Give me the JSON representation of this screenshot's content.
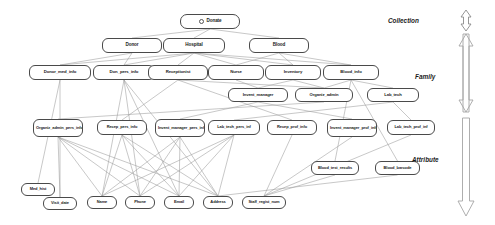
{
  "diagram": {
    "background": "#ffffff",
    "node_border_color": "#4a4a4a",
    "edge_color": "#9a9a9a",
    "levels": [
      {
        "name": "Collection",
        "label": "Collection"
      },
      {
        "name": "Family",
        "label": "Family"
      },
      {
        "name": "Attribute",
        "label": "Attribute"
      }
    ],
    "root_icon": "circle-node-icon",
    "nodes": [
      {
        "id": "donate",
        "label": "Donate",
        "x": 180,
        "y": 14,
        "w": 60,
        "h": 15,
        "fs": 4.6,
        "root": true
      },
      {
        "id": "donor",
        "label": "Donor",
        "x": 102,
        "y": 38,
        "w": 60,
        "h": 15,
        "fs": 4.6
      },
      {
        "id": "hospital",
        "label": "Hospital",
        "x": 163,
        "y": 38,
        "w": 62,
        "h": 15,
        "fs": 4.6
      },
      {
        "id": "blood",
        "label": "Blood",
        "x": 249,
        "y": 38,
        "w": 60,
        "h": 15,
        "fs": 4.6
      },
      {
        "id": "donor_med_info",
        "label": "Donor_med_info",
        "x": 29,
        "y": 65,
        "w": 62,
        "h": 15,
        "fs": 4.3
      },
      {
        "id": "don_pers_info",
        "label": "Don_pers_info",
        "x": 93,
        "y": 65,
        "w": 62,
        "h": 15,
        "fs": 4.3
      },
      {
        "id": "receptionist",
        "label": "Receptionist",
        "x": 148,
        "y": 65,
        "w": 60,
        "h": 15,
        "fs": 4.3
      },
      {
        "id": "nurse",
        "label": "Nurse",
        "x": 208,
        "y": 65,
        "w": 56,
        "h": 15,
        "fs": 4.3
      },
      {
        "id": "inventory",
        "label": "Inventory",
        "x": 265,
        "y": 65,
        "w": 56,
        "h": 15,
        "fs": 4.3
      },
      {
        "id": "blood_info",
        "label": "Blood_info",
        "x": 323,
        "y": 65,
        "w": 56,
        "h": 15,
        "fs": 4.3
      },
      {
        "id": "invent_manager",
        "label": "Invent_manager",
        "x": 228,
        "y": 88,
        "w": 60,
        "h": 14,
        "fs": 4.2
      },
      {
        "id": "organiz_admin",
        "label": "Organiz_admin",
        "x": 295,
        "y": 88,
        "w": 58,
        "h": 14,
        "fs": 4.2
      },
      {
        "id": "lab_tech",
        "label": "Lab_tech",
        "x": 367,
        "y": 88,
        "w": 52,
        "h": 14,
        "fs": 4.2
      },
      {
        "id": "organiz_admin_pers",
        "label": "Organiz_admin_pers_info",
        "x": 33,
        "y": 119,
        "w": 50,
        "h": 18,
        "fs": 4.0,
        "two": true
      },
      {
        "id": "recep_pers_info",
        "label": "Recep_pers_info",
        "x": 97,
        "y": 120,
        "w": 50,
        "h": 15,
        "fs": 4.0
      },
      {
        "id": "invent_manager_pers",
        "label": "Invent_manager_pers_info",
        "x": 155,
        "y": 119,
        "w": 50,
        "h": 18,
        "fs": 4.0,
        "two": true
      },
      {
        "id": "lab_tech_pers_inf",
        "label": "Lab_tech_pers_inf",
        "x": 208,
        "y": 120,
        "w": 52,
        "h": 15,
        "fs": 4.0
      },
      {
        "id": "recep_prof_info",
        "label": "Recep_prof_info",
        "x": 267,
        "y": 120,
        "w": 50,
        "h": 15,
        "fs": 4.0
      },
      {
        "id": "invent_manager_prof",
        "label": "Invent_manager_prof_info",
        "x": 327,
        "y": 119,
        "w": 50,
        "h": 18,
        "fs": 4.0,
        "two": true
      },
      {
        "id": "lab_tech_prof_inf",
        "label": "Lab_tech_prof_inf",
        "x": 387,
        "y": 120,
        "w": 48,
        "h": 15,
        "fs": 4.0
      },
      {
        "id": "blood_test_results",
        "label": "Blood_test_results",
        "x": 311,
        "y": 161,
        "w": 48,
        "h": 14,
        "fs": 4.0
      },
      {
        "id": "blood_barcode",
        "label": "Blood_barcode",
        "x": 375,
        "y": 161,
        "w": 45,
        "h": 14,
        "fs": 4.0
      },
      {
        "id": "med_hist",
        "label": "Med_hist",
        "x": 21,
        "y": 183,
        "w": 34,
        "h": 13,
        "fs": 4.0
      },
      {
        "id": "visit_date",
        "label": "Visit_date",
        "x": 43,
        "y": 197,
        "w": 34,
        "h": 13,
        "fs": 4.0
      },
      {
        "id": "name",
        "label": "Name",
        "x": 87,
        "y": 196,
        "w": 30,
        "h": 13,
        "fs": 4.0
      },
      {
        "id": "phone",
        "label": "Phone",
        "x": 125,
        "y": 196,
        "w": 30,
        "h": 13,
        "fs": 4.0
      },
      {
        "id": "email",
        "label": "Email",
        "x": 164,
        "y": 196,
        "w": 30,
        "h": 13,
        "fs": 4.0
      },
      {
        "id": "address",
        "label": "Address",
        "x": 203,
        "y": 196,
        "w": 30,
        "h": 13,
        "fs": 4.0
      },
      {
        "id": "staff_regist_num",
        "label": "Staff_regist_num",
        "x": 242,
        "y": 196,
        "w": 44,
        "h": 13,
        "fs": 4.0
      }
    ],
    "edges": [
      [
        "donate",
        "donor"
      ],
      [
        "donate",
        "hospital"
      ],
      [
        "donate",
        "blood"
      ],
      [
        "donor",
        "donor_med_info"
      ],
      [
        "donor",
        "don_pers_info"
      ],
      [
        "hospital",
        "receptionist"
      ],
      [
        "hospital",
        "nurse"
      ],
      [
        "hospital",
        "inventory"
      ],
      [
        "hospital",
        "don_pers_info"
      ],
      [
        "hospital",
        "donor_med_info"
      ],
      [
        "blood",
        "blood_info"
      ],
      [
        "blood",
        "inventory"
      ],
      [
        "blood",
        "nurse"
      ],
      [
        "hospital",
        "blood_info"
      ],
      [
        "inventory",
        "invent_manager"
      ],
      [
        "inventory",
        "organiz_admin"
      ],
      [
        "blood_info",
        "lab_tech"
      ],
      [
        "blood_info",
        "organiz_admin"
      ],
      [
        "nurse",
        "invent_manager"
      ],
      [
        "receptionist",
        "organiz_admin"
      ],
      [
        "organiz_admin",
        "organiz_admin_pers"
      ],
      [
        "receptionist",
        "recep_pers_info"
      ],
      [
        "receptionist",
        "recep_prof_info"
      ],
      [
        "invent_manager",
        "invent_manager_pers"
      ],
      [
        "invent_manager",
        "invent_manager_prof"
      ],
      [
        "lab_tech",
        "lab_tech_pers_inf"
      ],
      [
        "lab_tech",
        "lab_tech_prof_inf"
      ],
      [
        "blood_info",
        "blood_test_results"
      ],
      [
        "blood_info",
        "blood_barcode"
      ],
      [
        "donor_med_info",
        "med_hist"
      ],
      [
        "donor_med_info",
        "visit_date"
      ],
      [
        "don_pers_info",
        "name"
      ],
      [
        "don_pers_info",
        "phone"
      ],
      [
        "don_pers_info",
        "email"
      ],
      [
        "don_pers_info",
        "address"
      ],
      [
        "organiz_admin_pers",
        "name"
      ],
      [
        "organiz_admin_pers",
        "phone"
      ],
      [
        "organiz_admin_pers",
        "email"
      ],
      [
        "organiz_admin_pers",
        "address"
      ],
      [
        "recep_pers_info",
        "name"
      ],
      [
        "recep_pers_info",
        "phone"
      ],
      [
        "recep_pers_info",
        "email"
      ],
      [
        "recep_pers_info",
        "address"
      ],
      [
        "invent_manager_pers",
        "name"
      ],
      [
        "invent_manager_pers",
        "phone"
      ],
      [
        "invent_manager_pers",
        "email"
      ],
      [
        "invent_manager_pers",
        "address"
      ],
      [
        "lab_tech_pers_inf",
        "name"
      ],
      [
        "lab_tech_pers_inf",
        "phone"
      ],
      [
        "lab_tech_pers_inf",
        "email"
      ],
      [
        "lab_tech_pers_inf",
        "address"
      ],
      [
        "recep_prof_info",
        "staff_regist_num"
      ],
      [
        "invent_manager_prof",
        "staff_regist_num"
      ],
      [
        "lab_tech_prof_inf",
        "staff_regist_num"
      ],
      [
        "organiz_admin_pers",
        "visit_date"
      ],
      [
        "blood_test_results",
        "staff_regist_num"
      ],
      [
        "blood_barcode",
        "address"
      ]
    ]
  }
}
